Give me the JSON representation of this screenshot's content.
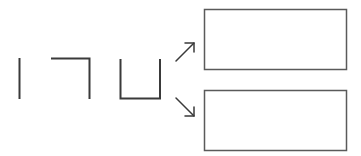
{
  "diagram": {
    "colors": {
      "stroke": "#3a3a3a",
      "box_border": "#5a5a5a",
      "background": "#ffffff"
    },
    "shapes": [
      {
        "id": "shape-1",
        "kind": "vertical-line",
        "segments": 1
      },
      {
        "id": "shape-2",
        "kind": "corner-angle",
        "segments": 2
      },
      {
        "id": "shape-3",
        "kind": "u-shape",
        "segments": 3
      }
    ],
    "arrows": [
      {
        "id": "arrow-up",
        "direction": "up-right",
        "target": "box-top"
      },
      {
        "id": "arrow-down",
        "direction": "down-right",
        "target": "box-bottom"
      }
    ],
    "boxes": [
      {
        "id": "box-top",
        "label": ""
      },
      {
        "id": "box-bottom",
        "label": ""
      }
    ]
  }
}
